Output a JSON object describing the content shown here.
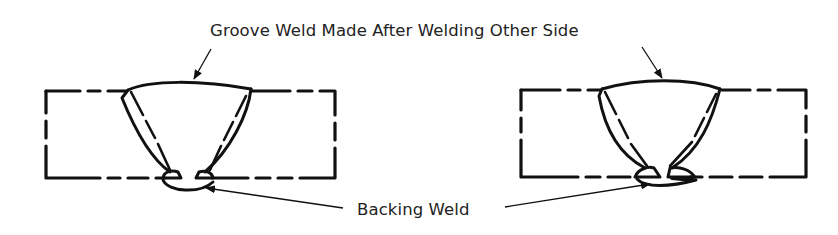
{
  "diagram": {
    "type": "welding-joint-cross-section",
    "labels": {
      "groove_weld": "Groove Weld Made After Welding Other Side",
      "backing_weld": "Backing Weld"
    },
    "figures": [
      {
        "id": "left",
        "description": "Double-bevel groove weld with backing weld on root side, two root passes"
      },
      {
        "id": "right",
        "description": "Double-bevel groove weld with backing weld on root side, two root passes"
      }
    ],
    "colors": {
      "line": "#111111",
      "text": "#222222",
      "background": "#ffffff"
    }
  }
}
